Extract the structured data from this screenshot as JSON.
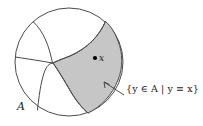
{
  "figure": {
    "type": "set-partition-diagram",
    "background_color": "#ffffff",
    "outline_color": "#4a4a4a",
    "shaded_region_color": "#c6c6c6",
    "point_color": "#000000"
  },
  "labels": {
    "set_label": "A",
    "point_label": "x",
    "equivalence_class_label": "{y ∈ A | y ≡ x}"
  },
  "geometry": {
    "circle": {
      "cx": 69,
      "cy": 62,
      "r": 54
    },
    "point_x": {
      "cx": 95,
      "cy": 58,
      "r": 2.1
    },
    "junction": {
      "x": 53,
      "y": 63
    }
  }
}
